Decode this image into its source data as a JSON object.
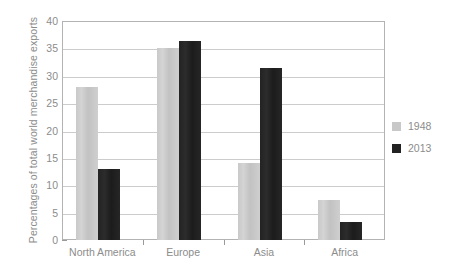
{
  "chart_data": {
    "type": "bar",
    "title": "",
    "xlabel": "",
    "ylabel": "Percentages of total world merchandise exports",
    "ylim": [
      0,
      40
    ],
    "ytick_step": 5,
    "yticks": [
      "40",
      "35",
      "30",
      "25",
      "20",
      "15",
      "10",
      "5",
      "0"
    ],
    "grid": true,
    "legend_position": "right",
    "categories": [
      "North America",
      "Europe",
      "Asia",
      "Africa"
    ],
    "series": [
      {
        "name": "1948",
        "color": "#c8c8c8",
        "values": [
          28,
          35,
          14,
          7.3
        ]
      },
      {
        "name": "2013",
        "color": "#222222",
        "values": [
          13,
          36.3,
          31.5,
          3.3
        ]
      }
    ]
  },
  "legend": {
    "items": [
      {
        "label": "1948",
        "color": "#c8c8c8"
      },
      {
        "label": "2013",
        "color": "#222222"
      }
    ]
  },
  "colors": {
    "axis": "#9a9a9a",
    "gridline": "#cccccc",
    "text": "#8c8c8c",
    "series_1948": "#c8c8c8",
    "series_2013": "#222222"
  }
}
